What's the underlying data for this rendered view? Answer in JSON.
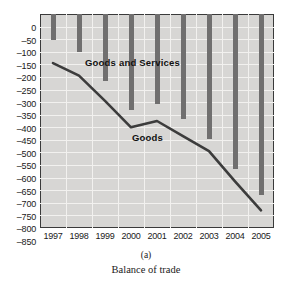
{
  "chart_data": {
    "type": "bar",
    "title": "",
    "caption_marker": "(a)",
    "caption_title": "Balance of trade",
    "xlabel": "",
    "ylabel": "",
    "categories": [
      "1997",
      "1998",
      "1999",
      "2000",
      "2001",
      "2002",
      "2003",
      "2004",
      "2005"
    ],
    "ylim": [
      -850,
      0
    ],
    "ytick_step": 50,
    "yticks": [
      0,
      -50,
      -100,
      -150,
      -200,
      -250,
      -300,
      -350,
      -400,
      -450,
      -500,
      -550,
      -600,
      -650,
      -700,
      -750,
      -800,
      -850
    ],
    "ytick_labels": [
      "0",
      "–50",
      "–100",
      "–150",
      "–200",
      "–250",
      "–300",
      "–350",
      "–400",
      "–450",
      "–500",
      "–550",
      "–600",
      "–650",
      "–700",
      "–750",
      "–800",
      "–850"
    ],
    "grid": true,
    "legend_position": "inline-annotations",
    "series": [
      {
        "name": "Goods and Services",
        "render": "bar",
        "color": "#706f6f",
        "values": [
          -105,
          -150,
          -265,
          -380,
          -358,
          -418,
          -495,
          -615,
          -717
        ]
      },
      {
        "name": "Goods",
        "render": "line",
        "color": "#3c3c3c",
        "values": [
          -195,
          -245,
          -345,
          -450,
          -425,
          -485,
          -545,
          -665,
          -780
        ]
      }
    ],
    "annotations": [
      {
        "text": "Goods and Services",
        "series": "Goods and Services"
      },
      {
        "text": "Goods",
        "series": "Goods"
      }
    ]
  }
}
